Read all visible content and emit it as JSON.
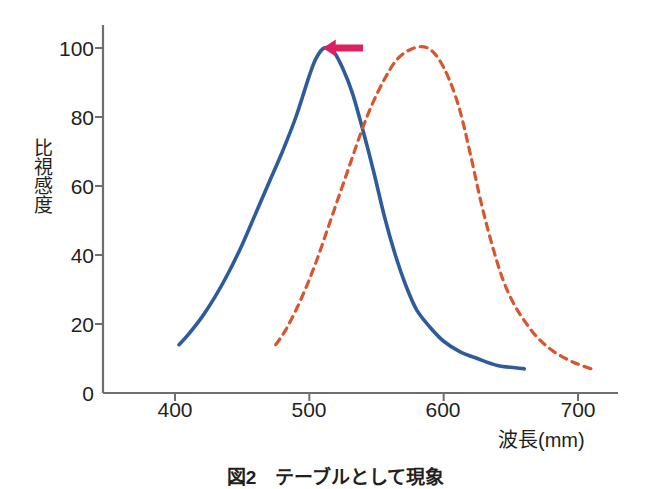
{
  "figure": {
    "caption": "図2　テーブルとして現象",
    "background_color": "#ffffff"
  },
  "axes": {
    "line_color": "#6d6e71",
    "x_label": "波長(mm)",
    "y_label": "比視感度",
    "x_ticks": [
      "400",
      "500",
      "600",
      "700"
    ],
    "y_ticks": [
      "0",
      "20",
      "40",
      "60",
      "80",
      "100"
    ]
  },
  "annotations": {
    "arrow": {
      "name": "leftward-shift-arrow",
      "color": "#DC2060",
      "direction": "left"
    }
  },
  "chart_data": {
    "type": "line",
    "title": "",
    "subtitle": "",
    "xlabel": "波長(mm)",
    "ylabel": "比視感度",
    "xlim": [
      355,
      730
    ],
    "ylim": [
      0,
      110
    ],
    "grid": false,
    "legend": "none",
    "x_ticks": [
      400,
      500,
      600,
      700
    ],
    "y_ticks": [
      0,
      20,
      40,
      60,
      80,
      100
    ],
    "annotations": [
      {
        "type": "arrow",
        "label": "",
        "color": "#DC2060",
        "direction": "left",
        "x_from": 540,
        "x_to": 510,
        "y": 100
      }
    ],
    "series": [
      {
        "name": "暗所視 (scotopic)",
        "style": "solid",
        "color": "#2E5C9A",
        "width": 3.6,
        "points": [
          [
            403,
            14
          ],
          [
            410,
            17
          ],
          [
            420,
            22
          ],
          [
            430,
            28
          ],
          [
            440,
            35
          ],
          [
            450,
            43
          ],
          [
            460,
            52
          ],
          [
            470,
            61
          ],
          [
            480,
            70
          ],
          [
            490,
            80
          ],
          [
            500,
            92
          ],
          [
            505,
            97
          ],
          [
            511,
            100
          ],
          [
            518,
            99
          ],
          [
            525,
            94
          ],
          [
            532,
            87
          ],
          [
            540,
            76
          ],
          [
            548,
            64
          ],
          [
            556,
            51
          ],
          [
            564,
            40
          ],
          [
            572,
            31
          ],
          [
            580,
            24
          ],
          [
            590,
            19
          ],
          [
            600,
            15
          ],
          [
            612,
            12
          ],
          [
            625,
            10
          ],
          [
            640,
            8
          ],
          [
            660,
            7
          ]
        ]
      },
      {
        "name": "明所視 (photopic)",
        "style": "dashed",
        "color": "#D9552E",
        "width": 3.2,
        "points": [
          [
            475,
            14
          ],
          [
            482,
            18
          ],
          [
            490,
            24
          ],
          [
            498,
            31
          ],
          [
            506,
            39
          ],
          [
            514,
            48
          ],
          [
            522,
            57
          ],
          [
            530,
            66
          ],
          [
            538,
            75
          ],
          [
            546,
            83
          ],
          [
            556,
            91
          ],
          [
            566,
            97
          ],
          [
            578,
            100
          ],
          [
            588,
            100
          ],
          [
            596,
            97
          ],
          [
            604,
            91
          ],
          [
            612,
            82
          ],
          [
            620,
            69
          ],
          [
            628,
            55
          ],
          [
            636,
            43
          ],
          [
            644,
            33
          ],
          [
            652,
            26
          ],
          [
            660,
            21
          ],
          [
            670,
            16
          ],
          [
            682,
            12
          ],
          [
            696,
            9
          ],
          [
            710,
            7
          ]
        ]
      }
    ]
  }
}
